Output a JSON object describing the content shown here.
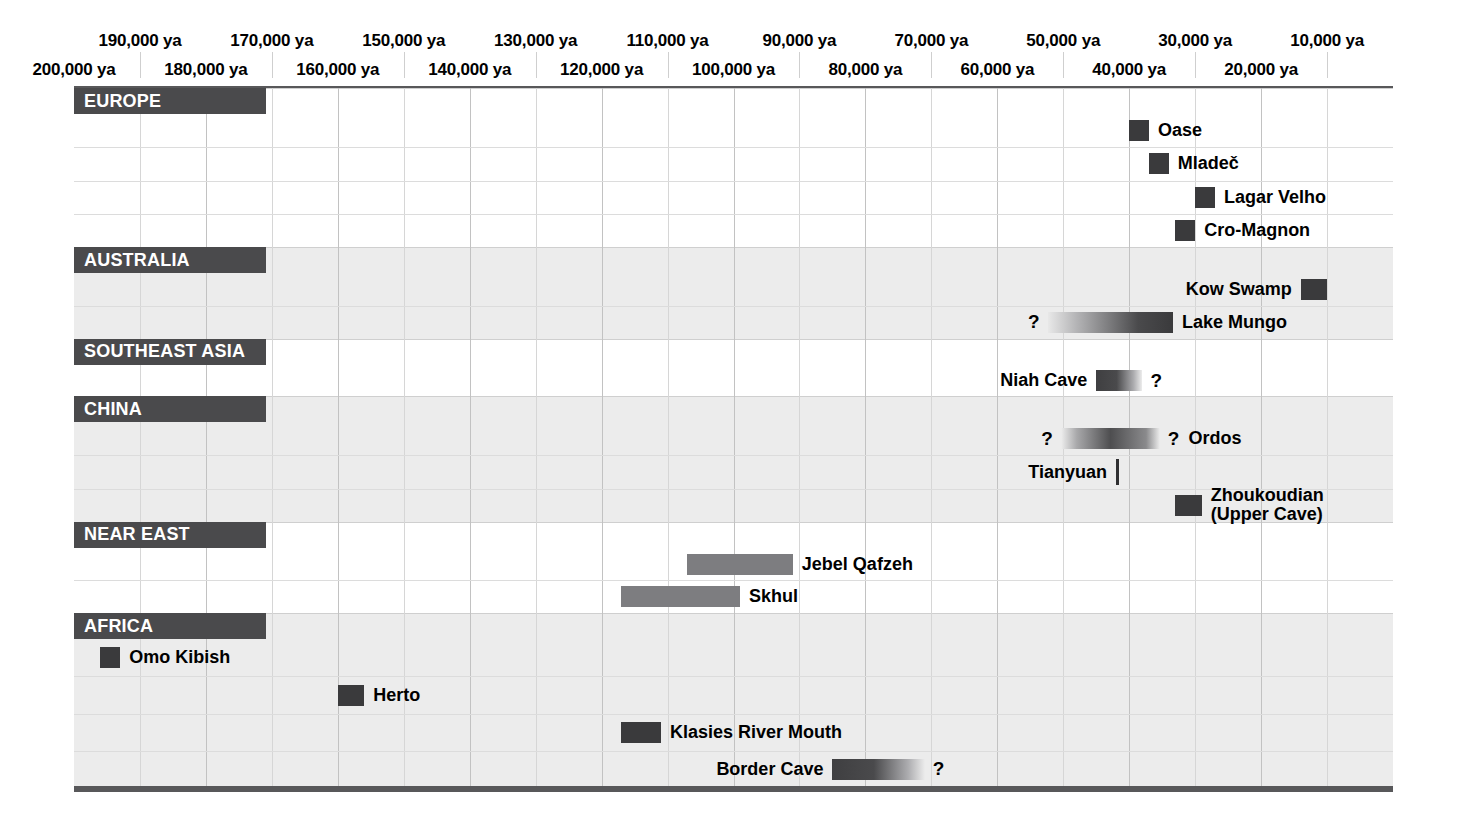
{
  "chart_data": {
    "type": "table",
    "title": "",
    "xlabel": "years ago",
    "axis": {
      "min_ya": 200000,
      "max_ya": 0,
      "direction": "oldest-left",
      "grid": true,
      "tick_step_ya": 10000,
      "labels_top": [
        "190,000 ya",
        "170,000 ya",
        "150,000 ya",
        "130,000 ya",
        "110,000 ya",
        "90,000 ya",
        "70,000 ya",
        "50,000 ya",
        "30,000 ya",
        "10,000 ya"
      ],
      "labels_bottom": [
        "200,000 ya",
        "180,000 ya",
        "160,000 ya",
        "140,000 ya",
        "120,000 ya",
        "100,000 ya",
        "80,000 ya",
        "60,000 ya",
        "40,000 ya",
        "20,000 ya"
      ],
      "labels_top_ya": [
        190000,
        170000,
        150000,
        130000,
        110000,
        90000,
        70000,
        50000,
        30000,
        10000
      ],
      "labels_bottom_ya": [
        200000,
        180000,
        160000,
        140000,
        120000,
        100000,
        80000,
        60000,
        40000,
        20000
      ]
    },
    "regions": [
      {
        "name": "EUROPE",
        "shaded": false,
        "entries": [
          {
            "site": "Oase",
            "start_ya": 40000,
            "end_ya": 37000,
            "style": "solid-dark",
            "label_side": "right",
            "q_left": false,
            "q_right": false
          },
          {
            "site": "Mladeč",
            "start_ya": 37000,
            "end_ya": 34000,
            "style": "solid-dark",
            "label_side": "right",
            "q_left": false,
            "q_right": false
          },
          {
            "site": "Lagar Velho",
            "start_ya": 30000,
            "end_ya": 27000,
            "style": "solid-dark",
            "label_side": "right",
            "q_left": false,
            "q_right": false
          },
          {
            "site": "Cro-Magnon",
            "start_ya": 33000,
            "end_ya": 30000,
            "style": "solid-dark",
            "label_side": "right",
            "q_left": false,
            "q_right": false
          }
        ]
      },
      {
        "name": "AUSTRALIA",
        "shaded": true,
        "entries": [
          {
            "site": "Kow Swamp",
            "start_ya": 14000,
            "end_ya": 10000,
            "style": "solid-dark",
            "label_side": "left",
            "q_left": false,
            "q_right": false
          },
          {
            "site": "Lake Mungo",
            "start_ya": 52000,
            "end_ya": 33000,
            "style": "grad-ld",
            "label_side": "right",
            "q_left": true,
            "q_right": false
          }
        ]
      },
      {
        "name": "SOUTHEAST ASIA",
        "shaded": false,
        "entries": [
          {
            "site": "Niah Cave",
            "start_ya": 45000,
            "end_ya": 38000,
            "style": "grad-dl",
            "label_side": "left",
            "q_left": false,
            "q_right": true
          }
        ]
      },
      {
        "name": "CHINA",
        "shaded": true,
        "entries": [
          {
            "site": "Ordos",
            "start_ya": 50000,
            "end_ya": 35000,
            "style": "grad-both",
            "label_side": "right",
            "q_left": true,
            "q_right": true
          },
          {
            "site": "Tianyuan",
            "start_ya": 42000,
            "end_ya": 42000,
            "style": "tick-line",
            "label_side": "left",
            "q_left": false,
            "q_right": false
          },
          {
            "site": "Zhoukoudian (Upper Cave)",
            "start_ya": 33000,
            "end_ya": 29000,
            "style": "solid-dark",
            "label_side": "right",
            "q_left": false,
            "q_right": false
          }
        ]
      },
      {
        "name": "NEAR EAST",
        "shaded": false,
        "entries": [
          {
            "site": "Jebel Qafzeh",
            "start_ya": 107000,
            "end_ya": 91000,
            "style": "solid-mid",
            "label_side": "right",
            "q_left": false,
            "q_right": false
          },
          {
            "site": "Skhul",
            "start_ya": 117000,
            "end_ya": 99000,
            "style": "solid-mid",
            "label_side": "right",
            "q_left": false,
            "q_right": false
          }
        ]
      },
      {
        "name": "AFRICA",
        "shaded": true,
        "entries": [
          {
            "site": "Omo Kibish",
            "start_ya": 196000,
            "end_ya": 193000,
            "style": "solid-dark",
            "label_side": "right",
            "q_left": false,
            "q_right": false
          },
          {
            "site": "Herto",
            "start_ya": 160000,
            "end_ya": 156000,
            "style": "solid-dark",
            "label_side": "right",
            "q_left": false,
            "q_right": false
          },
          {
            "site": "Klasies River Mouth",
            "start_ya": 117000,
            "end_ya": 111000,
            "style": "solid-dark",
            "label_side": "right",
            "q_left": false,
            "q_right": false
          },
          {
            "site": "Border Cave",
            "start_ya": 85000,
            "end_ya": 71000,
            "style": "grad-dl",
            "label_side": "left",
            "q_left": false,
            "q_right": true
          }
        ]
      }
    ],
    "legend": [],
    "annotations": [
      "?"
    ]
  },
  "colors": {
    "region_tab": "#4a4a4c",
    "bar_dark": "#3a3a3c",
    "bar_mid": "#7d7d80",
    "band_shaded": "#ececec",
    "grid": "#d6d6d6",
    "rule": "#58585a"
  },
  "symbols": {
    "uncertain": "?"
  }
}
